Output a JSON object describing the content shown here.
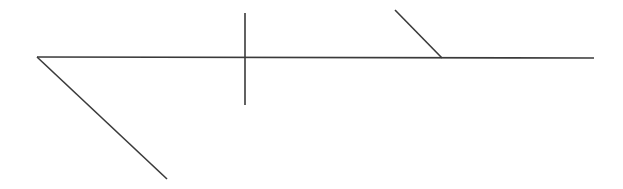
{
  "canvas": {
    "width": 623,
    "height": 189,
    "background_color": "#ffffff",
    "title": "Line Drawing"
  },
  "style": {
    "stroke_color": "#3a3a3a",
    "stroke_width": 1.6
  },
  "chart_data": {
    "type": "line",
    "title": "",
    "subtitle": "",
    "xlabel": "",
    "ylabel": "",
    "grid": false,
    "legend": "none",
    "xlim": [
      0,
      623
    ],
    "ylim": [
      0,
      189
    ],
    "annotations": [],
    "segments": [
      {
        "name": "horizontal-baseline",
        "x1": 37,
        "y1": 57,
        "x2": 594,
        "y2": 58,
        "color": "#3a3a3a",
        "width": 1.6
      },
      {
        "name": "left-descending-diagonal",
        "x1": 37,
        "y1": 57,
        "x2": 167,
        "y2": 179,
        "color": "#3a3a3a",
        "width": 1.6
      },
      {
        "name": "vertical-crossbar",
        "x1": 245,
        "y1": 13,
        "x2": 245,
        "y2": 105,
        "color": "#3a3a3a",
        "width": 1.6
      },
      {
        "name": "right-descending-diagonal",
        "x1": 395,
        "y1": 10,
        "x2": 442,
        "y2": 58,
        "color": "#3a3a3a",
        "width": 1.6
      }
    ],
    "vertices": [
      {
        "name": "left-junction",
        "x": 37,
        "y": 57
      },
      {
        "name": "crossing-point",
        "x": 245,
        "y": 57
      },
      {
        "name": "right-junction",
        "x": 442,
        "y": 58
      },
      {
        "name": "horizontal-right-end",
        "x": 594,
        "y": 58
      },
      {
        "name": "left-diagonal-end",
        "x": 167,
        "y": 179
      },
      {
        "name": "vertical-top-end",
        "x": 245,
        "y": 13
      },
      {
        "name": "vertical-bottom-end",
        "x": 245,
        "y": 105
      },
      {
        "name": "right-diagonal-top-end",
        "x": 395,
        "y": 10
      }
    ]
  }
}
